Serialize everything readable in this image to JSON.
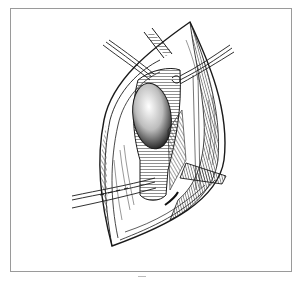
{
  "figure": {
    "kind": "surgical line illustration",
    "colors": {
      "ink": "#1a1a1a",
      "frame": "#9a9a9a",
      "background": "#ffffff",
      "hatch": "#555555"
    }
  }
}
